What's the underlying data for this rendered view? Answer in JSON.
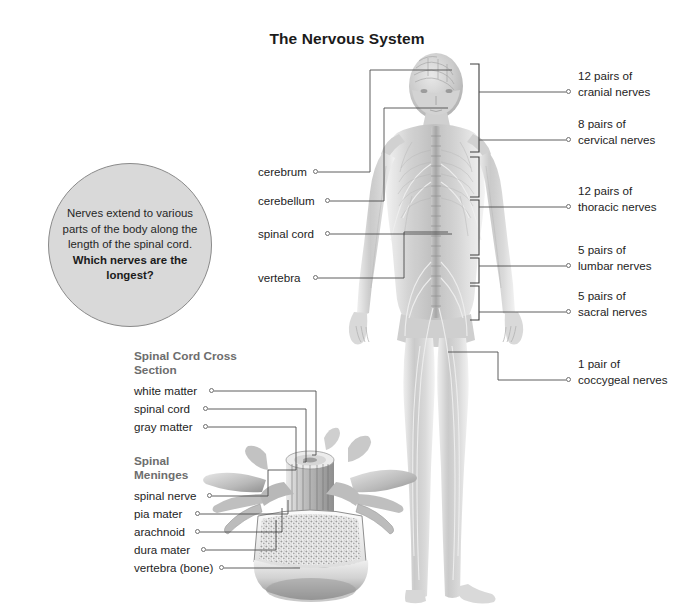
{
  "title": "The Nervous System",
  "callout": {
    "body": "Nerves extend to various parts of the body along the length of the spinal cord.",
    "question": "Which nerves are the longest?"
  },
  "right_labels": [
    {
      "line1": "12 pairs of",
      "line2": "cranial nerves"
    },
    {
      "line1": "8 pairs of",
      "line2": "cervical nerves"
    },
    {
      "line1": "12 pairs of",
      "line2": "thoracic nerves"
    },
    {
      "line1": "5 pairs of",
      "line2": "lumbar nerves"
    },
    {
      "line1": "5 pairs of",
      "line2": "sacral nerves"
    },
    {
      "line1": "1 pair of",
      "line2": "coccygeal nerves"
    }
  ],
  "figure_labels": [
    {
      "text": "cerebrum"
    },
    {
      "text": "cerebellum"
    },
    {
      "text": "spinal cord"
    },
    {
      "text": "vertebra"
    }
  ],
  "cross_section": {
    "heading_line1": "Spinal Cord Cross",
    "heading_line2": "Section",
    "labels": [
      {
        "text": "white matter"
      },
      {
        "text": "spinal cord"
      },
      {
        "text": "gray matter"
      }
    ]
  },
  "meninges": {
    "heading_line1": "Spinal",
    "heading_line2": "Meninges",
    "labels": [
      {
        "text": "spinal nerve"
      },
      {
        "text": "pia mater"
      },
      {
        "text": "arachnoid"
      },
      {
        "text": "dura mater"
      },
      {
        "text": "vertebra (bone)"
      }
    ]
  },
  "colors": {
    "text": "#1d1d1d",
    "heading_gray": "#6d6d6d",
    "callout_fill": "#d9d9d9",
    "callout_border": "#8a8a8a",
    "leader_line": "#4d4d4d"
  },
  "figures": [
    {
      "name": "full-body-nervous-system-illustration"
    },
    {
      "name": "vertebra-cross-section-illustration"
    }
  ]
}
